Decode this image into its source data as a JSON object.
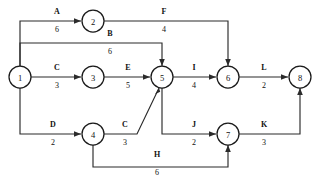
{
  "diagram": {
    "type": "activity-on-arrow-network",
    "nodes": [
      {
        "id": "1",
        "label": "1",
        "x": 20,
        "y": 77
      },
      {
        "id": "2",
        "label": "2",
        "x": 93,
        "y": 21
      },
      {
        "id": "3",
        "label": "3",
        "x": 93,
        "y": 77
      },
      {
        "id": "4",
        "label": "4",
        "x": 93,
        "y": 134
      },
      {
        "id": "5",
        "label": "5",
        "x": 162,
        "y": 77
      },
      {
        "id": "6",
        "label": "6",
        "x": 228,
        "y": 77
      },
      {
        "id": "7",
        "label": "7",
        "x": 228,
        "y": 134
      },
      {
        "id": "8",
        "label": "8",
        "x": 300,
        "y": 77
      }
    ],
    "edges": [
      {
        "name": "A",
        "weight": "6",
        "from": "1",
        "to": "2",
        "label_x": 57,
        "name_y": 14,
        "weight_y": 32
      },
      {
        "name": "B",
        "weight": "6",
        "from": "1",
        "to": "5",
        "label_x": 110,
        "name_y": 36,
        "weight_y": 54
      },
      {
        "name": "C",
        "weight": "3",
        "from": "1",
        "to": "3",
        "label_x": 57,
        "name_y": 70,
        "weight_y": 88
      },
      {
        "name": "D",
        "weight": "2",
        "from": "1",
        "to": "4",
        "label_x": 53,
        "name_y": 127,
        "weight_y": 145
      },
      {
        "name": "E",
        "weight": "5",
        "from": "3",
        "to": "5",
        "label_x": 128,
        "name_y": 70,
        "weight_y": 88
      },
      {
        "name": "C",
        "weight": "3",
        "from": "4",
        "to": "5",
        "label_x": 125,
        "name_y": 127,
        "weight_y": 145
      },
      {
        "name": "F",
        "weight": "4",
        "from": "2",
        "to": "6",
        "label_x": 164,
        "name_y": 14,
        "weight_y": 32
      },
      {
        "name": "I",
        "weight": "4",
        "from": "5",
        "to": "6",
        "label_x": 194,
        "name_y": 70,
        "weight_y": 88
      },
      {
        "name": "J",
        "weight": "2",
        "from": "5",
        "to": "7",
        "label_x": 194,
        "name_y": 127,
        "weight_y": 145
      },
      {
        "name": "H",
        "weight": "6",
        "from": "4",
        "to": "7",
        "label_x": 157,
        "name_y": 157,
        "weight_y": 175
      },
      {
        "name": "L",
        "weight": "2",
        "from": "6",
        "to": "8",
        "label_x": 264,
        "name_y": 70,
        "weight_y": 88
      },
      {
        "name": "K",
        "weight": "3",
        "from": "7",
        "to": "8",
        "label_x": 264,
        "name_y": 127,
        "weight_y": 145
      }
    ],
    "colors": {
      "stroke": "#2b2b2b",
      "node_stroke": "#1a1a1a",
      "node_fill": "#ffffff",
      "text": "#111111",
      "background": "#ffffff"
    }
  }
}
